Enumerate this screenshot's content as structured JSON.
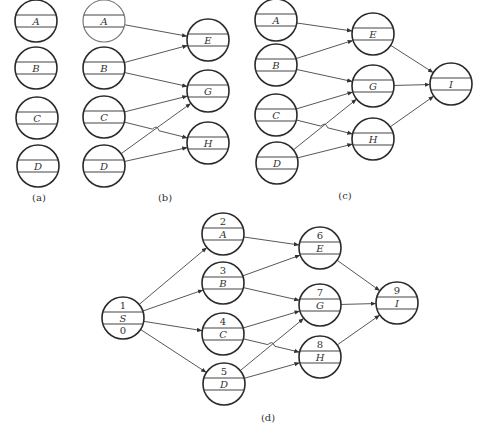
{
  "figure": {
    "panels": [
      {
        "id": "a",
        "caption": "(a)",
        "caption_pos": [
          39,
          201
        ],
        "nodes": [
          {
            "id": "A",
            "label": "A",
            "cx": 36,
            "cy": 21
          },
          {
            "id": "B",
            "label": "B",
            "cx": 36,
            "cy": 68
          },
          {
            "id": "C",
            "label": "C",
            "cx": 37,
            "cy": 118
          },
          {
            "id": "D",
            "label": "D",
            "cx": 38,
            "cy": 166
          }
        ],
        "edges": []
      },
      {
        "id": "b",
        "caption": "(b)",
        "caption_pos": [
          165,
          201
        ],
        "nodes": [
          {
            "id": "A",
            "label": "A",
            "cx": 104,
            "cy": 21,
            "light": true
          },
          {
            "id": "B",
            "label": "B",
            "cx": 104,
            "cy": 68
          },
          {
            "id": "C",
            "label": "C",
            "cx": 104,
            "cy": 117
          },
          {
            "id": "D",
            "label": "D",
            "cx": 104,
            "cy": 166
          },
          {
            "id": "E",
            "label": "E",
            "cx": 208,
            "cy": 40
          },
          {
            "id": "G",
            "label": "G",
            "cx": 208,
            "cy": 91
          },
          {
            "id": "H",
            "label": "H",
            "cx": 208,
            "cy": 143
          }
        ],
        "edges": [
          [
            "A",
            "E"
          ],
          [
            "B",
            "E"
          ],
          [
            "B",
            "G"
          ],
          [
            "C",
            "G"
          ],
          [
            "C",
            "H",
            "hop"
          ],
          [
            "D",
            "G"
          ],
          [
            "D",
            "H"
          ]
        ]
      },
      {
        "id": "c",
        "caption": "(c)",
        "caption_pos": [
          345,
          199
        ],
        "nodes": [
          {
            "id": "A",
            "label": "A",
            "cx": 276,
            "cy": 20
          },
          {
            "id": "B",
            "label": "B",
            "cx": 276,
            "cy": 65
          },
          {
            "id": "C",
            "label": "C",
            "cx": 276,
            "cy": 115
          },
          {
            "id": "D",
            "label": "D",
            "cx": 277,
            "cy": 163
          },
          {
            "id": "E",
            "label": "E",
            "cx": 373,
            "cy": 34
          },
          {
            "id": "G",
            "label": "G",
            "cx": 373,
            "cy": 86
          },
          {
            "id": "H",
            "label": "H",
            "cx": 373,
            "cy": 139
          },
          {
            "id": "I",
            "label": "I",
            "cx": 451,
            "cy": 84
          }
        ],
        "edges": [
          [
            "A",
            "E"
          ],
          [
            "B",
            "E"
          ],
          [
            "B",
            "G"
          ],
          [
            "C",
            "G"
          ],
          [
            "C",
            "H",
            "hop"
          ],
          [
            "D",
            "G"
          ],
          [
            "D",
            "H"
          ],
          [
            "E",
            "I"
          ],
          [
            "G",
            "I"
          ],
          [
            "H",
            "I"
          ]
        ]
      },
      {
        "id": "d",
        "caption": "(d)",
        "caption_pos": [
          268,
          421
        ],
        "nodes": [
          {
            "id": "S",
            "label": "S",
            "num": "1",
            "bottom": "0",
            "cx": 123,
            "cy": 318
          },
          {
            "id": "A",
            "label": "A",
            "num": "2",
            "cx": 223,
            "cy": 234
          },
          {
            "id": "B",
            "label": "B",
            "num": "3",
            "cx": 223,
            "cy": 283
          },
          {
            "id": "C",
            "label": "C",
            "num": "4",
            "cx": 223,
            "cy": 334
          },
          {
            "id": "D",
            "label": "D",
            "num": "5",
            "cx": 224,
            "cy": 384
          },
          {
            "id": "E",
            "label": "E",
            "num": "6",
            "cx": 320,
            "cy": 248
          },
          {
            "id": "G",
            "label": "G",
            "num": "7",
            "cx": 320,
            "cy": 305
          },
          {
            "id": "H",
            "label": "H",
            "num": "8",
            "cx": 320,
            "cy": 357
          },
          {
            "id": "I",
            "label": "I",
            "num": "9",
            "cx": 397,
            "cy": 303
          }
        ],
        "edges": [
          [
            "S",
            "A"
          ],
          [
            "S",
            "B"
          ],
          [
            "S",
            "C"
          ],
          [
            "S",
            "D"
          ],
          [
            "A",
            "E"
          ],
          [
            "B",
            "E"
          ],
          [
            "B",
            "G"
          ],
          [
            "C",
            "G"
          ],
          [
            "C",
            "H",
            "hop"
          ],
          [
            "D",
            "G"
          ],
          [
            "D",
            "H"
          ],
          [
            "E",
            "I"
          ],
          [
            "G",
            "I"
          ],
          [
            "H",
            "I"
          ]
        ]
      }
    ],
    "node_radius": 21,
    "colors": {
      "stroke": "#2a2a2a",
      "edge": "#444444",
      "background": "#ffffff"
    }
  }
}
